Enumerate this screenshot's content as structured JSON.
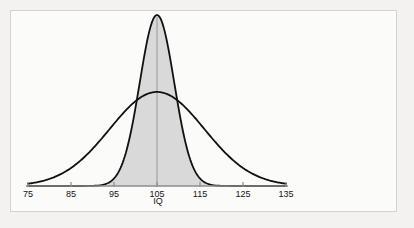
{
  "figure": {
    "background_color": "#f3f2f0",
    "panel_color": "#fbfbfa",
    "frame_color": "#d2d2d0"
  },
  "chart_data": {
    "type": "line",
    "title": "",
    "subtitle": "",
    "xlabel": "IQ",
    "ylabel": "",
    "xlim": [
      75,
      135
    ],
    "ylim": [
      0,
      1.0
    ],
    "grid": false,
    "legend": null,
    "x_ticks": [
      75,
      85,
      95,
      105,
      115,
      125,
      135
    ],
    "x_tick_labels": [
      "75",
      "85",
      "95",
      "105",
      "115",
      "125",
      "135"
    ],
    "y_ticks": [],
    "y_tick_labels": [],
    "annotations": [
      {
        "name": "center-reference-line",
        "x": 105,
        "description": "vertical line at the common mean IQ = 105"
      }
    ],
    "series": [
      {
        "name": "narrow-distribution",
        "kind": "normal-pdf",
        "mean": 105,
        "sd": 4.0,
        "peak_height": 1.0,
        "line_color": "#111111",
        "line_width": 1.8,
        "fill": true,
        "fill_color": "#d9d9d9",
        "x": [
          75,
          80,
          85,
          90,
          93,
          95,
          97,
          99,
          101,
          103,
          105,
          107,
          109,
          111,
          113,
          115,
          117,
          119,
          121,
          125,
          130,
          135
        ],
        "y": [
          0.0,
          0.0,
          0.0,
          0.002,
          0.011,
          0.044,
          0.135,
          0.324,
          0.607,
          0.882,
          1.0,
          0.882,
          0.607,
          0.324,
          0.135,
          0.044,
          0.011,
          0.002,
          0.0,
          0.0,
          0.0,
          0.0
        ]
      },
      {
        "name": "wide-distribution",
        "kind": "normal-pdf",
        "mean": 105,
        "sd": 11.0,
        "peak_height": 0.55,
        "line_color": "#111111",
        "line_width": 1.8,
        "fill": false,
        "fill_color": "none",
        "x": [
          75,
          79,
          83,
          87,
          91,
          94,
          97,
          100,
          102,
          105,
          108,
          110,
          113,
          116,
          119,
          123,
          127,
          131,
          135
        ],
        "y": [
          0.018,
          0.041,
          0.084,
          0.154,
          0.25,
          0.33,
          0.418,
          0.494,
          0.528,
          0.55,
          0.528,
          0.504,
          0.447,
          0.369,
          0.288,
          0.187,
          0.108,
          0.055,
          0.018
        ]
      }
    ]
  },
  "axis": {
    "line_color": "#8c8c8c",
    "tick_color": "#8c8c8c",
    "tick_labels": [
      "75",
      "85",
      "95",
      "105",
      "115",
      "125",
      "135"
    ],
    "axis_title": "IQ"
  }
}
